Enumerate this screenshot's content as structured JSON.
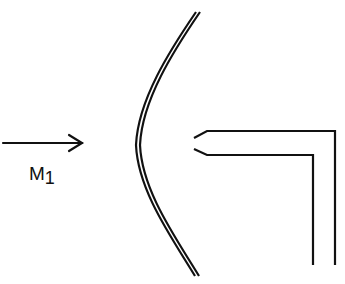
{
  "diagram": {
    "flow_arrow": {
      "label_main": "M",
      "label_sub": "1",
      "direction": "right"
    },
    "shock_wave": {
      "shape": "detached bow shock",
      "style": "double line"
    },
    "probe": {
      "shape": "pitot tube",
      "orientation": "facing left, bending downward"
    },
    "colors": {
      "stroke": "#111111",
      "background": "#ffffff"
    }
  }
}
